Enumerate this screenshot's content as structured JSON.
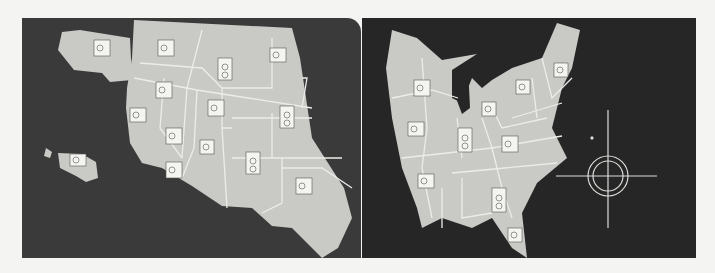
{
  "figure": {
    "panels": [
      {
        "name": "west",
        "regions": [
          "Alaska",
          "Hawaii",
          "Western US states"
        ],
        "camera_icons": 15
      },
      {
        "name": "east",
        "regions": [
          "Eastern US states",
          "Great Lakes"
        ],
        "camera_icons": 10
      }
    ],
    "compass": {
      "north_label": "N",
      "east_label": "E",
      "west_label": "W",
      "south_label": "S"
    },
    "colors": {
      "board_left": "#3a3a3a",
      "board_right": "#262626",
      "land": "#c9c9c6",
      "borders": "#ecece8",
      "background": "#f4f4f2"
    }
  }
}
